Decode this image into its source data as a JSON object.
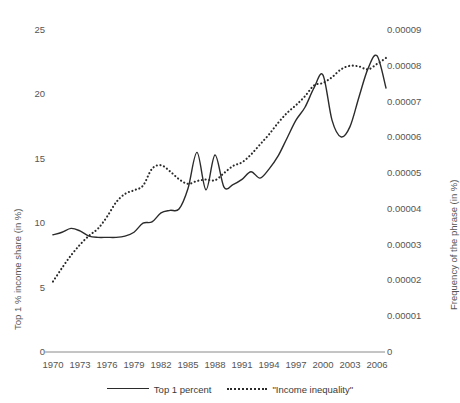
{
  "chart_data": {
    "type": "line",
    "title": "",
    "xlabel": "",
    "ylabel": "Top 1 % income share (in %)",
    "y2label": "Frequency of the phrase (in %)",
    "xlim": [
      1970,
      2006
    ],
    "ylim": [
      0,
      25
    ],
    "y2lim": [
      0,
      9e-05
    ],
    "grid": false,
    "legend_position": "bottom",
    "x_ticks": [
      "1970",
      "1973",
      "1976",
      "1979",
      "1982",
      "1985",
      "1988",
      "1991",
      "1994",
      "1997",
      "2000",
      "2003",
      "2006"
    ],
    "x_tick_values": [
      1970,
      1973,
      1976,
      1979,
      1982,
      1985,
      1988,
      1991,
      1994,
      1997,
      2000,
      2003,
      2006
    ],
    "y_ticks": [
      "0",
      "5",
      "10",
      "15",
      "20",
      "25"
    ],
    "y_tick_values": [
      0,
      5,
      10,
      15,
      20,
      25
    ],
    "y2_ticks": [
      "0",
      "0.00001",
      "0.00002",
      "0.00003",
      "0.00004",
      "0.00005",
      "0.00006",
      "0.00007",
      "0.00008",
      "0.00009"
    ],
    "y2_tick_values": [
      0,
      1e-05,
      2e-05,
      3e-05,
      4e-05,
      5e-05,
      6e-05,
      7e-05,
      8e-05,
      9e-05
    ],
    "x": [
      1970,
      1971,
      1972,
      1973,
      1974,
      1975,
      1976,
      1977,
      1978,
      1979,
      1980,
      1981,
      1982,
      1983,
      1984,
      1985,
      1986,
      1987,
      1988,
      1989,
      1990,
      1991,
      1992,
      1993,
      1994,
      1995,
      1996,
      1997,
      1998,
      1999,
      2000,
      2001,
      2002,
      2003,
      2004,
      2005,
      2006,
      2007
    ],
    "series": [
      {
        "name": "Top 1 percent",
        "axis": "left",
        "style": "solid",
        "color": "#2b2b2b",
        "values": [
          9.1,
          9.3,
          9.6,
          9.4,
          9.0,
          8.9,
          8.9,
          8.9,
          9.0,
          9.3,
          10.0,
          10.1,
          10.8,
          11.0,
          11.1,
          12.7,
          15.5,
          12.6,
          15.3,
          12.8,
          13.0,
          13.4,
          14.0,
          13.5,
          14.2,
          15.2,
          16.6,
          18.0,
          19.0,
          20.5,
          21.5,
          18.0,
          16.7,
          17.5,
          19.8,
          22.0,
          23.0,
          20.5
        ]
      },
      {
        "name": "\"Income inequality\"",
        "axis": "right",
        "style": "dotted",
        "color": "#2b2b2b",
        "values": [
          1.97e-05,
          2.35e-05,
          2.7e-05,
          3e-05,
          3.25e-05,
          3.45e-05,
          3.78e-05,
          4.18e-05,
          4.42e-05,
          4.52e-05,
          4.65e-05,
          5.12e-05,
          5.22e-05,
          5.05e-05,
          4.83e-05,
          4.7e-05,
          4.78e-05,
          4.82e-05,
          4.8e-05,
          5e-05,
          5.2e-05,
          5.3e-05,
          5.52e-05,
          5.8e-05,
          6.08e-05,
          6.4e-05,
          6.68e-05,
          6.9e-05,
          7.15e-05,
          7.45e-05,
          7.52e-05,
          7.68e-05,
          7.9e-05,
          8e-05,
          7.98e-05,
          7.9e-05,
          8.05e-05,
          8.22e-05
        ]
      }
    ],
    "legend": [
      "Top 1 percent",
      "\"Income inequality\""
    ]
  }
}
